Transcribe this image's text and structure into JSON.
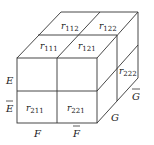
{
  "cells": {
    "r112": {
      "base": "r",
      "sub": "112"
    },
    "r122": {
      "base": "r",
      "sub": "122"
    },
    "r111": {
      "base": "r",
      "sub": "111"
    },
    "r121": {
      "base": "r",
      "sub": "121"
    },
    "r222": {
      "base": "r",
      "sub": "222"
    },
    "r211": {
      "base": "r",
      "sub": "211"
    },
    "r221": {
      "base": "r",
      "sub": "221"
    }
  },
  "labels": {
    "E": "E",
    "E_bar": "E",
    "F": "F",
    "F_bar": "F",
    "G": "G",
    "G_bar": "G"
  }
}
